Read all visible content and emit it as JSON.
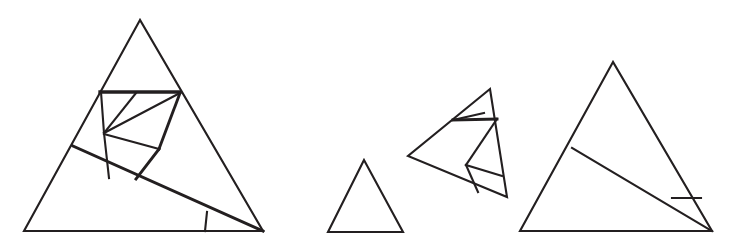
{
  "figure": {
    "background_color": "#ffffff",
    "stroke_color": "#231f20",
    "canvas": {
      "width": 735,
      "height": 251
    },
    "shape_count": 4
  },
  "shapes": [
    {
      "name": "large-left-triangle",
      "label": "Large left triangle with full dissection",
      "vertices": [
        [
          140,
          20
        ],
        [
          24,
          231
        ],
        [
          263,
          231
        ]
      ],
      "outline_points": "140,20 24,231 263,231",
      "stroke_width": 2.1,
      "segments": [
        {
          "name": "upper-horizontal-cut",
          "points": "100,92 180,92",
          "stroke_width": 3.3
        },
        {
          "name": "inner-left-vertical",
          "points": "101,92 104,133",
          "stroke_width": 2.1
        },
        {
          "name": "inner-left-lower-vertical",
          "points": "104,133 109,178",
          "stroke_width": 2.1
        },
        {
          "name": "upper-notch-left",
          "points": "136,93 104,133",
          "stroke_width": 2.1
        },
        {
          "name": "upper-notch-right",
          "points": "104,133 180,93",
          "stroke_width": 2.1
        },
        {
          "name": "mid-wedge-cut",
          "points": "104,134 159,149",
          "stroke_width": 2.1
        },
        {
          "name": "right-inner-slant",
          "points": "180,93 159,149",
          "stroke_width": 2.9
        },
        {
          "name": "right-inner-lower-slant",
          "points": "159,149 136,179",
          "stroke_width": 2.9
        },
        {
          "name": "long-diagonal-cut",
          "points": "73,146 263,231",
          "stroke_width": 2.9
        },
        {
          "name": "bottom-right-sliver",
          "points": "207,212 205,231",
          "stroke_width": 2.1
        }
      ]
    },
    {
      "name": "small-plain-triangle",
      "label": "Small plain triangle (undissected)",
      "vertices": [
        [
          364,
          160
        ],
        [
          328,
          232
        ],
        [
          403,
          232
        ]
      ],
      "outline_points": "364,160 328,232 403,232",
      "stroke_width": 2.1,
      "segments": []
    },
    {
      "name": "medium-tilted-triangle",
      "label": "Medium tilted triangle with dissection",
      "vertices": [
        [
          490,
          89
        ],
        [
          408,
          156
        ],
        [
          507,
          197
        ]
      ],
      "outline_points": "490,89 408,156 507,197",
      "stroke_width": 2.1,
      "segments": [
        {
          "name": "upper-horizontal-cut",
          "points": "453,120 497,119",
          "stroke_width": 2.9
        },
        {
          "name": "upper-notch-slant",
          "points": "453,120 484,113",
          "stroke_width": 2.1
        },
        {
          "name": "right-inner-slant",
          "points": "497,119 466,165",
          "stroke_width": 2.1
        },
        {
          "name": "mid-wedge-cut",
          "points": "466,165 502,176",
          "stroke_width": 2.1
        },
        {
          "name": "lower-inner-slant",
          "points": "466,165 478,192",
          "stroke_width": 2.1
        }
      ]
    },
    {
      "name": "right-large-triangle",
      "label": "Right large triangle with single diagonal cut",
      "vertices": [
        [
          613,
          62
        ],
        [
          520,
          231
        ],
        [
          712,
          231
        ]
      ],
      "outline_points": "613,62 520,231 712,231",
      "stroke_width": 2.1,
      "segments": [
        {
          "name": "long-diagonal-cut",
          "points": "572,148 712,231",
          "stroke_width": 2.1
        },
        {
          "name": "bottom-right-sliver",
          "points": "672,198 701,198",
          "stroke_width": 2.1
        }
      ]
    }
  ]
}
